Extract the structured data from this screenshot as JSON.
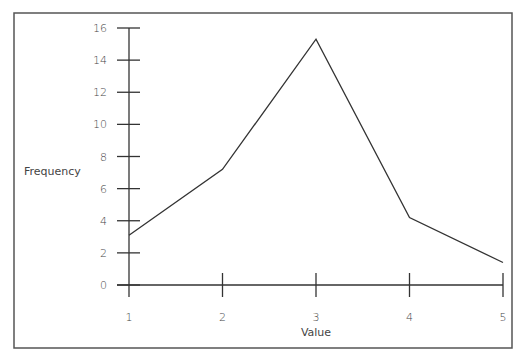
{
  "chart_data": {
    "type": "line",
    "title": "",
    "xlabel": "Value",
    "ylabel": "Frequency",
    "x": [
      1,
      2,
      3,
      4,
      5
    ],
    "values": [
      3.1,
      7.2,
      15.3,
      4.2,
      1.4
    ],
    "series": [
      {
        "name": "Frequency",
        "values": [
          3.1,
          7.2,
          15.3,
          4.2,
          1.4
        ]
      }
    ],
    "xticks": [
      "1",
      "2",
      "3",
      "4",
      "5"
    ],
    "yticks": [
      "0",
      "2",
      "4",
      "6",
      "8",
      "10",
      "12",
      "14",
      "16"
    ],
    "xlim": [
      1,
      5
    ],
    "ylim": [
      0,
      16
    ],
    "grid": false,
    "legend": "none"
  },
  "colors": {
    "line": "#333333",
    "axis": "#333333",
    "border": "#555555",
    "text": "#444444"
  }
}
